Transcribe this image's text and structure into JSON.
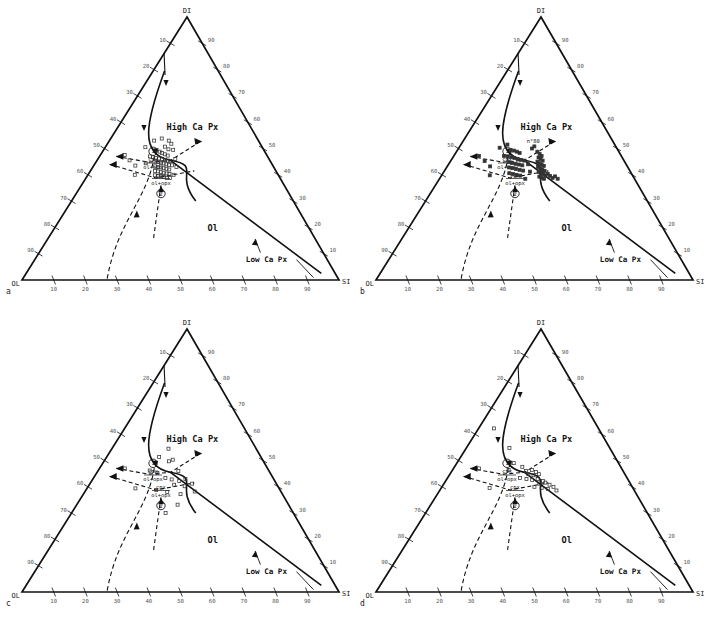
{
  "figure": {
    "panels": [
      {
        "letter": "a"
      },
      {
        "letter": "b"
      },
      {
        "letter": "c"
      },
      {
        "letter": "d"
      }
    ],
    "apex_labels": {
      "top": "DI",
      "left": "OL",
      "right": "SI"
    },
    "field_labels": {
      "high_ca": "High Ca Px",
      "ol": "Ol",
      "low_ca": "Low Ca Px"
    },
    "reaction_labels": {
      "cpx": "cpx",
      "ol_opx": "ol+opx",
      "marker_one": "1",
      "marker_two": "2"
    },
    "annotation_b": "n°80",
    "tick_labels": [
      "10",
      "20",
      "30",
      "40",
      "50",
      "60",
      "70",
      "80",
      "90"
    ],
    "colors": {
      "line": "#111111",
      "tick_text": "#555555",
      "marker": "#333333"
    }
  },
  "chart_data": {
    "type": "scatter",
    "xlabel": "OL - SI",
    "ylabel": "DI",
    "ternary_axes": {
      "top_apex": "DI",
      "left_apex": "OL",
      "right_apex": "SI",
      "tick_interval": 10,
      "tick_values": [
        10,
        20,
        30,
        40,
        50,
        60,
        70,
        80,
        90
      ],
      "bottom_axis_direction": "OL to SI, 10 to 90",
      "left_axis_direction": "DI to OL, 10 at top to 90 at bottom",
      "right_axis_direction": "DI to SI, 90 at top to 10 at bottom"
    },
    "grid": false,
    "legend": "none",
    "fields": [
      {
        "name": "High Ca Px",
        "position_xy": [
          0.5,
          0.45
        ]
      },
      {
        "name": "Ol",
        "position_xy": [
          0.58,
          0.8
        ]
      },
      {
        "name": "Low Ca Px",
        "position_xy": [
          0.74,
          0.9
        ]
      }
    ],
    "boundaries": [
      {
        "name": "cpx-ol cotectic (curved)",
        "style": "solid"
      },
      {
        "name": "ol - low Ca px boundary",
        "style": "solid"
      },
      {
        "name": "reaction boundary 1 (cpx = ol+opx)",
        "style": "dashed"
      },
      {
        "name": "reaction boundary 2 (cpx = ol+opx)",
        "style": "dashed"
      }
    ],
    "series": [
      {
        "name": "panel a",
        "panel": "a",
        "marker": "open-square",
        "count": 54,
        "points": [
          [
            0.255,
            0.495
          ],
          [
            0.3,
            0.47
          ],
          [
            0.348,
            0.462
          ],
          [
            0.38,
            0.493
          ],
          [
            0.404,
            0.503
          ],
          [
            0.33,
            0.505
          ],
          [
            0.352,
            0.512
          ],
          [
            0.368,
            0.517
          ],
          [
            0.386,
            0.522
          ],
          [
            0.405,
            0.527
          ],
          [
            0.3,
            0.53
          ],
          [
            0.32,
            0.533
          ],
          [
            0.338,
            0.536
          ],
          [
            0.356,
            0.538
          ],
          [
            0.374,
            0.54
          ],
          [
            0.392,
            0.543
          ],
          [
            0.41,
            0.546
          ],
          [
            0.424,
            0.548
          ],
          [
            0.34,
            0.55
          ],
          [
            0.356,
            0.552
          ],
          [
            0.372,
            0.555
          ],
          [
            0.388,
            0.557
          ],
          [
            0.404,
            0.56
          ],
          [
            0.42,
            0.562
          ],
          [
            0.436,
            0.564
          ],
          [
            0.344,
            0.568
          ],
          [
            0.36,
            0.57
          ],
          [
            0.376,
            0.572
          ],
          [
            0.392,
            0.575
          ],
          [
            0.408,
            0.577
          ],
          [
            0.424,
            0.58
          ],
          [
            0.348,
            0.585
          ],
          [
            0.364,
            0.587
          ],
          [
            0.38,
            0.59
          ],
          [
            0.396,
            0.592
          ],
          [
            0.412,
            0.595
          ],
          [
            0.428,
            0.597
          ],
          [
            0.352,
            0.602
          ],
          [
            0.368,
            0.604
          ],
          [
            0.384,
            0.606
          ],
          [
            0.4,
            0.609
          ],
          [
            0.416,
            0.612
          ],
          [
            0.146,
            0.525
          ],
          [
            0.188,
            0.545
          ],
          [
            0.232,
            0.565
          ],
          [
            0.246,
            0.6
          ],
          [
            0.432,
            0.612
          ],
          [
            0.45,
            0.6
          ],
          [
            0.462,
            0.57
          ],
          [
            0.452,
            0.54
          ],
          [
            0.434,
            0.505
          ],
          [
            0.418,
            0.482
          ],
          [
            0.398,
            0.47
          ],
          [
            0.286,
            0.556
          ]
        ]
      },
      {
        "name": "panel b",
        "panel": "b",
        "marker": "filled-square-dense",
        "count": 62,
        "points": [
          [
            0.258,
            0.497
          ],
          [
            0.302,
            0.485
          ],
          [
            0.33,
            0.505
          ],
          [
            0.352,
            0.508
          ],
          [
            0.372,
            0.512
          ],
          [
            0.39,
            0.517
          ],
          [
            0.3,
            0.528
          ],
          [
            0.322,
            0.53
          ],
          [
            0.344,
            0.533
          ],
          [
            0.364,
            0.536
          ],
          [
            0.384,
            0.54
          ],
          [
            0.404,
            0.543
          ],
          [
            0.424,
            0.546
          ],
          [
            0.336,
            0.552
          ],
          [
            0.356,
            0.555
          ],
          [
            0.376,
            0.558
          ],
          [
            0.396,
            0.561
          ],
          [
            0.416,
            0.564
          ],
          [
            0.344,
            0.572
          ],
          [
            0.364,
            0.575
          ],
          [
            0.384,
            0.578
          ],
          [
            0.404,
            0.581
          ],
          [
            0.424,
            0.584
          ],
          [
            0.352,
            0.594
          ],
          [
            0.372,
            0.597
          ],
          [
            0.392,
            0.6
          ],
          [
            0.412,
            0.603
          ],
          [
            0.498,
            0.512
          ],
          [
            0.512,
            0.52
          ],
          [
            0.524,
            0.528
          ],
          [
            0.506,
            0.534
          ],
          [
            0.518,
            0.54
          ],
          [
            0.53,
            0.546
          ],
          [
            0.5,
            0.55
          ],
          [
            0.512,
            0.556
          ],
          [
            0.524,
            0.561
          ],
          [
            0.536,
            0.566
          ],
          [
            0.504,
            0.57
          ],
          [
            0.516,
            0.575
          ],
          [
            0.528,
            0.58
          ],
          [
            0.54,
            0.585
          ],
          [
            0.508,
            0.589
          ],
          [
            0.52,
            0.594
          ],
          [
            0.532,
            0.598
          ],
          [
            0.544,
            0.602
          ],
          [
            0.512,
            0.607
          ],
          [
            0.524,
            0.611
          ],
          [
            0.536,
            0.615
          ],
          [
            0.556,
            0.596
          ],
          [
            0.568,
            0.604
          ],
          [
            0.58,
            0.612
          ],
          [
            0.594,
            0.606
          ],
          [
            0.606,
            0.615
          ],
          [
            0.464,
            0.5
          ],
          [
            0.478,
            0.492
          ],
          [
            0.15,
            0.528
          ],
          [
            0.196,
            0.548
          ],
          [
            0.238,
            0.568
          ],
          [
            0.252,
            0.602
          ],
          [
            0.44,
            0.615
          ],
          [
            0.462,
            0.588
          ],
          [
            0.448,
            0.56
          ]
        ]
      },
      {
        "name": "panel c",
        "panel": "c",
        "marker": "open-square",
        "count": 22,
        "points": [
          [
            0.392,
            0.455
          ],
          [
            0.34,
            0.487
          ],
          [
            0.408,
            0.503
          ],
          [
            0.43,
            0.497
          ],
          [
            0.302,
            0.538
          ],
          [
            0.35,
            0.548
          ],
          [
            0.47,
            0.54
          ],
          [
            0.4,
            0.566
          ],
          [
            0.436,
            0.572
          ],
          [
            0.478,
            0.578
          ],
          [
            0.512,
            0.57
          ],
          [
            0.452,
            0.592
          ],
          [
            0.508,
            0.598
          ],
          [
            0.548,
            0.588
          ],
          [
            0.362,
            0.612
          ],
          [
            0.42,
            0.62
          ],
          [
            0.488,
            0.628
          ],
          [
            0.56,
            0.618
          ],
          [
            0.476,
            0.668
          ],
          [
            0.424,
            0.7
          ],
          [
            0.252,
            0.606
          ],
          [
            0.15,
            0.53
          ]
        ]
      },
      {
        "name": "panel d",
        "panel": "d",
        "marker": "open-square",
        "count": 26,
        "points": [
          [
            0.3,
            0.452
          ],
          [
            0.128,
            0.378
          ],
          [
            0.352,
            0.51
          ],
          [
            0.408,
            0.524
          ],
          [
            0.33,
            0.536
          ],
          [
            0.432,
            0.54
          ],
          [
            0.468,
            0.536
          ],
          [
            0.492,
            0.544
          ],
          [
            0.448,
            0.552
          ],
          [
            0.478,
            0.556
          ],
          [
            0.508,
            0.552
          ],
          [
            0.404,
            0.566
          ],
          [
            0.44,
            0.57
          ],
          [
            0.472,
            0.574
          ],
          [
            0.502,
            0.57
          ],
          [
            0.532,
            0.578
          ],
          [
            0.512,
            0.588
          ],
          [
            0.544,
            0.584
          ],
          [
            0.566,
            0.592
          ],
          [
            0.486,
            0.6
          ],
          [
            0.524,
            0.604
          ],
          [
            0.556,
            0.608
          ],
          [
            0.586,
            0.6
          ],
          [
            0.6,
            0.614
          ],
          [
            0.252,
            0.604
          ],
          [
            0.152,
            0.53
          ]
        ]
      }
    ]
  }
}
